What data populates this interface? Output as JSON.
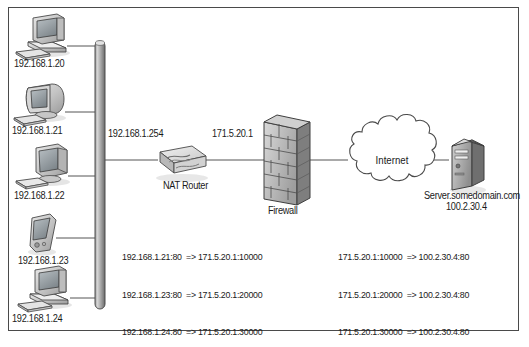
{
  "diagram": {
    "background_color": "#ffffff",
    "border_color": "#4a4a4a",
    "line_color": "#555555",
    "text_color": "#1a1a1a"
  },
  "backbone": {
    "name": "network-backbone-bus",
    "orientation": "vertical"
  },
  "clients": [
    {
      "icon": "desktop-computer-icon",
      "label": "192.168.1.20"
    },
    {
      "icon": "crt-monitor-computer-icon",
      "label": "192.168.1.21"
    },
    {
      "icon": "flat-panel-computer-icon",
      "label": "192.168.1.22"
    },
    {
      "icon": "pda-handheld-icon",
      "label": "192.168.1.23"
    },
    {
      "icon": "desktop-computer-icon",
      "label": "192.168.1.24"
    }
  ],
  "devices": {
    "router": {
      "icon": "router-icon",
      "label": "NAT Router",
      "lan_address": "192.168.1.254",
      "wan_address": "171.5.20.1"
    },
    "firewall": {
      "icon": "brick-wall-firewall-icon",
      "label": "Firewall"
    },
    "internet": {
      "icon": "cloud-icon",
      "label": "Internet"
    },
    "server": {
      "icon": "tower-server-icon",
      "label": "Server.somedomain.com",
      "address": "100.2.30.4"
    }
  },
  "mappings": {
    "inbound": {
      "name": "lan-to-wan-port-mappings",
      "rows": [
        "192.168.1.21:80  => 171.5.20.1:10000",
        "192.168.1.23:80  => 171.5.20.1:20000",
        "192.168.1.24:80  => 171.5.20.1:30000"
      ]
    },
    "outbound": {
      "name": "wan-to-server-port-mappings",
      "rows": [
        "171.5.20.1:10000  => 100.2.30.4:80",
        "171.5.20.1:20000  => 100.2.30.4:80",
        "171.5.20.1:30000  => 100.2.30.4:80"
      ]
    }
  }
}
